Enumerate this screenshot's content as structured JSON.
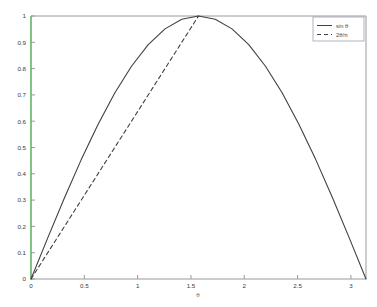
{
  "chart_data": {
    "type": "line",
    "title": "",
    "subtitle": "",
    "xlabel": "θ",
    "ylabel": "",
    "xlim": [
      0,
      3.14159265
    ],
    "ylim": [
      0,
      1
    ],
    "grid": false,
    "legend_position": "upper-right",
    "x_ticks": [
      0,
      0.5,
      1,
      1.5,
      2,
      2.5,
      3
    ],
    "x_tick_labels": [
      "0",
      "0.5",
      "1",
      "1.5",
      "2",
      "2.5",
      "3"
    ],
    "y_ticks": [
      0,
      0.1,
      0.2,
      0.3,
      0.4,
      0.5,
      0.6,
      0.7,
      0.8,
      0.9,
      1
    ],
    "y_tick_labels": [
      "0",
      "0.1",
      "0.2",
      "0.3",
      "0.4",
      "0.5",
      "0.6",
      "0.7",
      "0.8",
      "0.9",
      "1"
    ],
    "series": [
      {
        "name": "sin θ",
        "style": "solid",
        "color": "#404040",
        "x": [
          0,
          0.15708,
          0.31416,
          0.47124,
          0.62832,
          0.7854,
          0.94248,
          1.09956,
          1.25664,
          1.41372,
          1.5708,
          1.72788,
          1.88496,
          2.04204,
          2.19911,
          2.35619,
          2.51327,
          2.67035,
          2.82743,
          2.98451,
          3.14159
        ],
        "y": [
          0,
          0.15643,
          0.30902,
          0.45399,
          0.58779,
          0.70711,
          0.80902,
          0.89101,
          0.95106,
          0.98769,
          1.0,
          0.98769,
          0.95106,
          0.89101,
          0.80902,
          0.70711,
          0.58779,
          0.45399,
          0.30902,
          0.15643,
          0
        ]
      },
      {
        "name": "2θ/π",
        "style": "dashed",
        "color": "#404040",
        "x": [
          0,
          1.5708
        ],
        "y": [
          0,
          1.0
        ]
      }
    ],
    "annotations": []
  },
  "figure": {
    "background_color": "#ffffff",
    "axis_frame_color": "#9a9a9a",
    "y_axis_line_color": "#4dbf58",
    "legend_border_color": "#9aa0b0",
    "legend_background": "#ffffff"
  },
  "legend": {
    "entries": [
      {
        "label": "sin θ",
        "style": "solid"
      },
      {
        "label": "2θ/π",
        "style": "dashed"
      }
    ]
  }
}
